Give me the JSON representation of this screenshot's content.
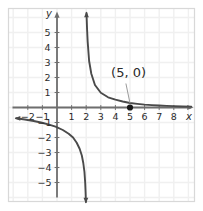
{
  "figure": {
    "kind": "coordinate-graph",
    "background_color": "#ffffff",
    "frame_color": "#d8d8d8",
    "grid_color": "#f0f0f0",
    "axis_color": "#6e6e6e",
    "curve_color": "#4a4a4a",
    "point_color": "#1a1a1a",
    "label_color": "#2b2b2b"
  },
  "axes": {
    "x_axis_label": "x",
    "y_axis_label": "y",
    "x_ticks": [
      "−2",
      "−1",
      "1",
      "2",
      "3",
      "4",
      "5",
      "6",
      "7",
      "8"
    ],
    "x_tick_values": [
      -2,
      -1,
      1,
      2,
      3,
      4,
      5,
      6,
      7,
      8
    ],
    "y_ticks": [
      "5",
      "4",
      "3",
      "2",
      "1",
      "−1",
      "−2",
      "−3",
      "−4",
      "−5"
    ],
    "y_tick_values": [
      5,
      4,
      3,
      2,
      1,
      -1,
      -2,
      -3,
      -4,
      -5
    ],
    "x_range": [
      -2.8,
      9.2
    ],
    "y_range": [
      -6.3,
      6.3
    ],
    "grid": true
  },
  "annotations": [
    {
      "name": "point-label",
      "text": "(5, 0)",
      "text_x": 4.9,
      "text_y": 2.05,
      "leader_from": [
        4.72,
        1.6
      ],
      "leader_to": [
        5.0,
        0.28
      ]
    }
  ],
  "points": [
    {
      "name": "x-intercept",
      "label": "(5, 0)",
      "x": 5,
      "y": 0
    }
  ],
  "chart_data": {
    "type": "line",
    "title": "",
    "xlabel": "x",
    "ylabel": "y",
    "xlim": [
      -2.8,
      9.2
    ],
    "ylim": [
      -6.3,
      6.3
    ],
    "grid": true,
    "legend": "none",
    "vertical_asymptote": 2.0,
    "horizontal_asymptote": 0.0,
    "series": [
      {
        "name": "right-branch",
        "comment": "decreasing branch for x greater than the asymptote, approaching y=0",
        "x": [
          2.02,
          2.06,
          2.1,
          2.2,
          2.35,
          2.6,
          3.0,
          3.5,
          4.0,
          4.5,
          5.0,
          5.5,
          6.0,
          6.5,
          7.0,
          7.5,
          8.0,
          8.6,
          9.2
        ],
        "y": [
          6.3,
          5.2,
          4.4,
          3.1,
          2.25,
          1.5,
          0.98,
          0.68,
          0.52,
          0.4,
          0.3,
          0.24,
          0.19,
          0.16,
          0.13,
          0.11,
          0.09,
          0.07,
          0.06
        ],
        "arrow_start": true,
        "arrow_end": false
      },
      {
        "name": "left-branch",
        "comment": "decreasing branch for x less than the asymptote, approaching y=0 from below",
        "x": [
          -2.8,
          -2.2,
          -1.6,
          -1.1,
          -0.6,
          -0.1,
          0.4,
          0.8,
          1.1,
          1.35,
          1.55,
          1.7,
          1.8,
          1.88,
          1.93,
          1.96,
          1.98
        ],
        "y": [
          -0.72,
          -0.8,
          -0.9,
          -1.0,
          -1.12,
          -1.28,
          -1.5,
          -1.75,
          -2.0,
          -2.35,
          -2.75,
          -3.2,
          -3.7,
          -4.3,
          -5.0,
          -5.7,
          -6.3
        ],
        "arrow_start": true,
        "arrow_end": true
      }
    ]
  }
}
